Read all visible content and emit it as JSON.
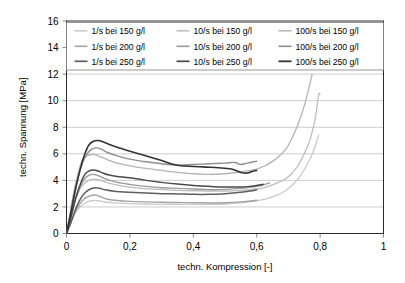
{
  "chart_data": {
    "type": "line",
    "title": "",
    "xlabel": "techn. Kompression [-]",
    "ylabel": "techn. Spannung [MPa]",
    "xlim": [
      0,
      1
    ],
    "ylim": [
      0,
      16
    ],
    "xticks": [
      0,
      0.2,
      0.4,
      0.6,
      0.8,
      1
    ],
    "xtick_labels": [
      "0",
      "0,2",
      "0,4",
      "0,6",
      "0,8",
      "1"
    ],
    "yticks": [
      0,
      2,
      4,
      6,
      8,
      10,
      12,
      14,
      16
    ],
    "ytick_labels": [
      "0",
      "2",
      "4",
      "6",
      "8",
      "10",
      "12",
      "14",
      "16"
    ],
    "grid": "horizontal",
    "legend_position": "top-inside",
    "legend_columns": 3,
    "series": [
      {
        "name": "1/s bei 150 g/l",
        "color": "#c9c9c9",
        "width": 1.3,
        "points": [
          [
            0,
            0
          ],
          [
            0.01,
            0.55
          ],
          [
            0.02,
            1.15
          ],
          [
            0.03,
            1.65
          ],
          [
            0.045,
            2.05
          ],
          [
            0.06,
            2.3
          ],
          [
            0.075,
            2.45
          ],
          [
            0.09,
            2.5
          ],
          [
            0.105,
            2.45
          ],
          [
            0.12,
            2.38
          ],
          [
            0.15,
            2.3
          ],
          [
            0.2,
            2.25
          ],
          [
            0.25,
            2.22
          ],
          [
            0.3,
            2.2
          ],
          [
            0.35,
            2.2
          ],
          [
            0.4,
            2.2
          ],
          [
            0.45,
            2.2
          ],
          [
            0.5,
            2.22
          ],
          [
            0.55,
            2.3
          ],
          [
            0.6,
            2.45
          ],
          [
            0.63,
            2.6
          ],
          [
            0.66,
            2.85
          ],
          [
            0.69,
            3.2
          ],
          [
            0.71,
            3.6
          ],
          [
            0.73,
            4.1
          ],
          [
            0.75,
            4.8
          ],
          [
            0.77,
            5.7
          ],
          [
            0.785,
            6.6
          ],
          [
            0.795,
            7.4
          ]
        ]
      },
      {
        "name": "1/s bei 200 g/l",
        "color": "#bdbdbd",
        "width": 1.3,
        "points": [
          [
            0,
            0
          ],
          [
            0.01,
            0.9
          ],
          [
            0.02,
            1.85
          ],
          [
            0.03,
            2.7
          ],
          [
            0.04,
            3.3
          ],
          [
            0.055,
            3.75
          ],
          [
            0.07,
            4.0
          ],
          [
            0.085,
            4.1
          ],
          [
            0.1,
            4.05
          ],
          [
            0.12,
            3.9
          ],
          [
            0.15,
            3.7
          ],
          [
            0.2,
            3.5
          ],
          [
            0.25,
            3.38
          ],
          [
            0.3,
            3.3
          ],
          [
            0.35,
            3.25
          ],
          [
            0.4,
            3.22
          ],
          [
            0.45,
            3.2
          ],
          [
            0.5,
            3.2
          ],
          [
            0.55,
            3.25
          ],
          [
            0.6,
            3.35
          ],
          [
            0.63,
            3.5
          ],
          [
            0.66,
            3.75
          ],
          [
            0.69,
            4.1
          ],
          [
            0.71,
            4.5
          ],
          [
            0.73,
            5.1
          ],
          [
            0.75,
            6.0
          ],
          [
            0.77,
            7.2
          ],
          [
            0.785,
            8.7
          ],
          [
            0.795,
            10.4
          ],
          [
            0.8,
            10.5
          ]
        ]
      },
      {
        "name": "1/s bei 250 g/l",
        "color": "#b4b4b4",
        "width": 1.3,
        "points": [
          [
            0,
            0
          ],
          [
            0.01,
            1.3
          ],
          [
            0.02,
            2.7
          ],
          [
            0.03,
            3.9
          ],
          [
            0.04,
            4.85
          ],
          [
            0.05,
            5.5
          ],
          [
            0.065,
            5.85
          ],
          [
            0.08,
            5.95
          ],
          [
            0.095,
            5.9
          ],
          [
            0.11,
            5.75
          ],
          [
            0.13,
            5.55
          ],
          [
            0.16,
            5.3
          ],
          [
            0.2,
            5.1
          ],
          [
            0.25,
            4.9
          ],
          [
            0.3,
            4.75
          ],
          [
            0.35,
            4.6
          ],
          [
            0.4,
            4.5
          ],
          [
            0.45,
            4.45
          ],
          [
            0.5,
            4.5
          ],
          [
            0.55,
            4.65
          ],
          [
            0.6,
            4.85
          ],
          [
            0.63,
            5.15
          ],
          [
            0.66,
            5.6
          ],
          [
            0.69,
            6.3
          ],
          [
            0.71,
            7.1
          ],
          [
            0.73,
            8.2
          ],
          [
            0.75,
            9.6
          ],
          [
            0.765,
            11.0
          ],
          [
            0.775,
            12.0
          ]
        ]
      },
      {
        "name": "10/s bei 150 g/l",
        "color": "#a3a3a3",
        "width": 1.4,
        "points": [
          [
            0,
            0
          ],
          [
            0.012,
            0.7
          ],
          [
            0.025,
            1.5
          ],
          [
            0.04,
            2.15
          ],
          [
            0.055,
            2.6
          ],
          [
            0.07,
            2.8
          ],
          [
            0.085,
            2.9
          ],
          [
            0.1,
            2.85
          ],
          [
            0.115,
            2.7
          ],
          [
            0.13,
            2.58
          ],
          [
            0.16,
            2.48
          ],
          [
            0.2,
            2.42
          ],
          [
            0.25,
            2.38
          ],
          [
            0.3,
            2.35
          ],
          [
            0.35,
            2.33
          ],
          [
            0.4,
            2.32
          ],
          [
            0.45,
            2.3
          ],
          [
            0.5,
            2.32
          ],
          [
            0.55,
            2.38
          ],
          [
            0.58,
            2.45
          ],
          [
            0.6,
            2.5
          ]
        ]
      },
      {
        "name": "10/s bei 200 g/l",
        "color": "#9a9a9a",
        "width": 1.4,
        "points": [
          [
            0,
            0
          ],
          [
            0.012,
            1.1
          ],
          [
            0.025,
            2.3
          ],
          [
            0.04,
            3.3
          ],
          [
            0.052,
            3.95
          ],
          [
            0.065,
            4.3
          ],
          [
            0.08,
            4.45
          ],
          [
            0.095,
            4.4
          ],
          [
            0.11,
            4.25
          ],
          [
            0.13,
            4.05
          ],
          [
            0.16,
            3.85
          ],
          [
            0.2,
            3.7
          ],
          [
            0.25,
            3.55
          ],
          [
            0.3,
            3.45
          ],
          [
            0.35,
            3.4
          ],
          [
            0.4,
            3.35
          ],
          [
            0.45,
            3.3
          ],
          [
            0.5,
            3.32
          ],
          [
            0.55,
            3.4
          ],
          [
            0.58,
            3.5
          ],
          [
            0.6,
            3.55
          ],
          [
            0.62,
            3.65
          ],
          [
            0.64,
            3.8
          ]
        ]
      },
      {
        "name": "10/s bei 250 g/l",
        "color": "#8e8e8e",
        "width": 1.4,
        "points": [
          [
            0,
            0
          ],
          [
            0.012,
            1.5
          ],
          [
            0.025,
            3.1
          ],
          [
            0.04,
            4.5
          ],
          [
            0.052,
            5.4
          ],
          [
            0.065,
            6.0
          ],
          [
            0.08,
            6.35
          ],
          [
            0.095,
            6.45
          ],
          [
            0.11,
            6.35
          ],
          [
            0.13,
            6.1
          ],
          [
            0.16,
            5.85
          ],
          [
            0.2,
            5.6
          ],
          [
            0.25,
            5.4
          ],
          [
            0.3,
            5.25
          ],
          [
            0.35,
            5.15
          ],
          [
            0.4,
            5.2
          ],
          [
            0.45,
            5.25
          ],
          [
            0.5,
            5.3
          ],
          [
            0.53,
            5.35
          ],
          [
            0.55,
            5.2
          ],
          [
            0.57,
            5.3
          ],
          [
            0.6,
            5.45
          ]
        ]
      },
      {
        "name": "100/s bei 150 g/l",
        "color": "#5f5f5f",
        "width": 1.5,
        "points": [
          [
            0,
            0
          ],
          [
            0.015,
            0.9
          ],
          [
            0.03,
            1.9
          ],
          [
            0.045,
            2.65
          ],
          [
            0.06,
            3.1
          ],
          [
            0.075,
            3.35
          ],
          [
            0.09,
            3.45
          ],
          [
            0.105,
            3.4
          ],
          [
            0.12,
            3.3
          ],
          [
            0.15,
            3.18
          ],
          [
            0.2,
            3.1
          ],
          [
            0.25,
            3.05
          ],
          [
            0.3,
            3.0
          ],
          [
            0.35,
            2.98
          ],
          [
            0.4,
            2.95
          ],
          [
            0.45,
            2.95
          ],
          [
            0.5,
            3.0
          ],
          [
            0.55,
            3.1
          ],
          [
            0.58,
            3.2
          ],
          [
            0.6,
            3.3
          ]
        ]
      },
      {
        "name": "100/s bei 200 g/l",
        "color": "#4a4a4a",
        "width": 1.5,
        "points": [
          [
            0,
            0
          ],
          [
            0.015,
            1.3
          ],
          [
            0.03,
            2.75
          ],
          [
            0.045,
            3.8
          ],
          [
            0.058,
            4.45
          ],
          [
            0.07,
            4.7
          ],
          [
            0.085,
            4.78
          ],
          [
            0.1,
            4.7
          ],
          [
            0.115,
            4.55
          ],
          [
            0.135,
            4.4
          ],
          [
            0.16,
            4.3
          ],
          [
            0.2,
            4.2
          ],
          [
            0.25,
            4.0
          ],
          [
            0.3,
            3.85
          ],
          [
            0.35,
            3.72
          ],
          [
            0.4,
            3.62
          ],
          [
            0.45,
            3.55
          ],
          [
            0.5,
            3.5
          ],
          [
            0.55,
            3.5
          ],
          [
            0.58,
            3.55
          ],
          [
            0.6,
            3.62
          ],
          [
            0.62,
            3.7
          ]
        ]
      },
      {
        "name": "100/s bei 250 g/l",
        "color": "#333333",
        "width": 1.6,
        "points": [
          [
            0,
            0
          ],
          [
            0.015,
            1.7
          ],
          [
            0.03,
            3.5
          ],
          [
            0.045,
            5.0
          ],
          [
            0.058,
            6.0
          ],
          [
            0.07,
            6.65
          ],
          [
            0.085,
            6.95
          ],
          [
            0.1,
            7.0
          ],
          [
            0.115,
            6.9
          ],
          [
            0.135,
            6.7
          ],
          [
            0.16,
            6.5
          ],
          [
            0.2,
            6.2
          ],
          [
            0.25,
            5.85
          ],
          [
            0.3,
            5.5
          ],
          [
            0.33,
            5.25
          ],
          [
            0.36,
            5.1
          ],
          [
            0.4,
            5.05
          ],
          [
            0.44,
            5.0
          ],
          [
            0.48,
            4.95
          ],
          [
            0.52,
            4.85
          ],
          [
            0.55,
            4.6
          ],
          [
            0.57,
            4.55
          ],
          [
            0.59,
            4.7
          ],
          [
            0.6,
            4.75
          ]
        ]
      }
    ]
  },
  "legend": {
    "entries": [
      "1/s bei 150 g/l",
      "10/s bei 150 g/l",
      "100/s bei 150 g/l",
      "1/s bei 200 g/l",
      "10/s bei 200 g/l",
      "100/s bei 200 g/l",
      "1/s bei 250 g/l",
      "10/s bei 250 g/l",
      "100/s bei 250 g/l"
    ]
  },
  "colors": {
    "grid": "#b8b8b8",
    "border": "#2b2b2b",
    "background": "#ffffff",
    "text": "#000000"
  }
}
